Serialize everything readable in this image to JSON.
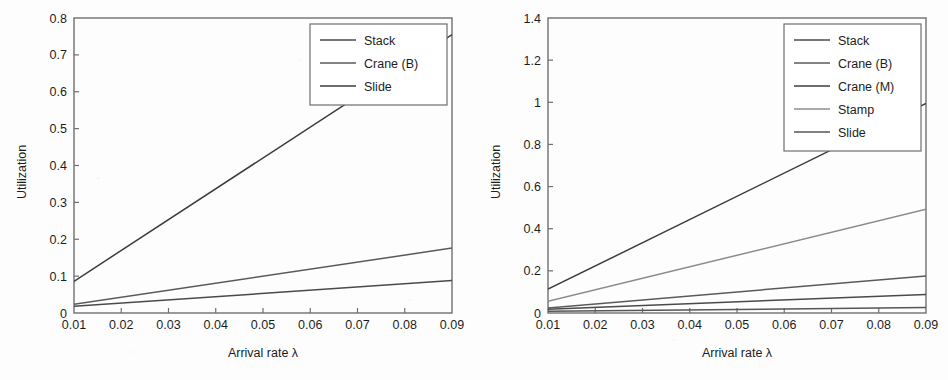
{
  "figure": {
    "background_color": "#fdfdfd",
    "panels": [
      "left",
      "right"
    ]
  },
  "chart_data": [
    {
      "id": "left",
      "type": "line",
      "title": "",
      "xlabel": "Arrival rate λ",
      "ylabel": "Utilization",
      "xlim": [
        0.01,
        0.09
      ],
      "ylim": [
        0,
        0.8
      ],
      "xticks": [
        0.01,
        0.02,
        0.03,
        0.04,
        0.05,
        0.06,
        0.07,
        0.08,
        0.09
      ],
      "xtick_labels": [
        "0.01",
        "0.02",
        "0.03",
        "0.04",
        "0.05",
        "0.06",
        "0.07",
        "0.08",
        "0.09"
      ],
      "yticks": [
        0,
        0.1,
        0.2,
        0.3,
        0.4,
        0.5,
        0.6,
        0.7,
        0.8
      ],
      "ytick_labels": [
        "0",
        "0.1",
        "0.2",
        "0.3",
        "0.4",
        "0.5",
        "0.6",
        "0.7",
        "0.8"
      ],
      "grid": false,
      "legend_position": "upper right",
      "x": [
        0.01,
        0.09
      ],
      "series": [
        {
          "name": "Stack",
          "color": "#4a4a4a",
          "values": [
            0.018,
            0.088
          ],
          "x": [
            0.01,
            0.09
          ]
        },
        {
          "name": "Crane (B)",
          "color": "#5a5a5a",
          "values": [
            0.024,
            0.176
          ],
          "x": [
            0.01,
            0.09
          ]
        },
        {
          "name": "Slide",
          "color": "#3d3d3d",
          "values": [
            0.086,
            0.755
          ],
          "x": [
            0.01,
            0.09
          ]
        }
      ]
    },
    {
      "id": "right",
      "type": "line",
      "title": "",
      "xlabel": "Arrival rate λ",
      "ylabel": "Utilization",
      "xlim": [
        0.01,
        0.09
      ],
      "ylim": [
        0,
        1.4
      ],
      "xticks": [
        0.01,
        0.02,
        0.03,
        0.04,
        0.05,
        0.06,
        0.07,
        0.08,
        0.09
      ],
      "xtick_labels": [
        "0.01",
        "0.02",
        "0.03",
        "0.04",
        "0.05",
        "0.06",
        "0.07",
        "0.08",
        "0.09"
      ],
      "yticks": [
        0,
        0.2,
        0.4,
        0.6,
        0.8,
        1,
        1.2,
        1.4
      ],
      "ytick_labels": [
        "0",
        "0.2",
        "0.4",
        "0.6",
        "0.8",
        "1",
        "1.2",
        "1.4"
      ],
      "grid": false,
      "legend_position": "upper right",
      "x": [
        0.01,
        0.09
      ],
      "series": [
        {
          "name": "Stack",
          "color": "#4a4a4a",
          "values": [
            0.018,
            0.088
          ],
          "x": [
            0.01,
            0.09
          ]
        },
        {
          "name": "Crane (B)",
          "color": "#5a5a5a",
          "values": [
            0.024,
            0.176
          ],
          "x": [
            0.01,
            0.09
          ]
        },
        {
          "name": "Crane (M)",
          "color": "#3d3d3d",
          "values": [
            0.113,
            0.995
          ],
          "x": [
            0.01,
            0.09
          ]
        },
        {
          "name": "Stamp",
          "color": "#8c8c8c",
          "values": [
            0.056,
            0.492
          ],
          "x": [
            0.01,
            0.09
          ]
        },
        {
          "name": "Slide",
          "color": "#565656",
          "values": [
            0.008,
            0.026
          ],
          "x": [
            0.01,
            0.09
          ]
        }
      ]
    }
  ]
}
